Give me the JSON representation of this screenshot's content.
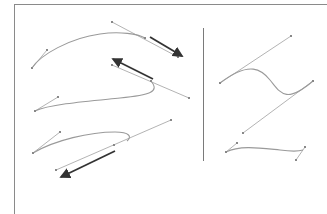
{
  "diagram": {
    "title": "",
    "colors": {
      "background": "#ffffff",
      "frame": "#8a8a8a",
      "divider": "#7a7a7a",
      "curve": "#9a9a9a",
      "handle": "#aaaaaa",
      "anchor": "#888888",
      "arrow": "#333333"
    },
    "left_panel": {
      "curves": [
        {
          "name": "curve-1",
          "path": "M32,68 C40,55 70,38 100,34 C120,31 138,34 145,38",
          "handles": [
            [
              32,
              68,
              47,
              50
            ],
            [
              112,
              22,
              178,
              57
            ]
          ],
          "anchors": [
            [
              32,
              68
            ],
            [
              47,
              50
            ],
            [
              112,
              22
            ],
            [
              145,
              38
            ],
            [
              178,
              57
            ]
          ],
          "arrow": {
            "from": [
              150,
              37
            ],
            "to": [
              182,
              56
            ]
          }
        },
        {
          "name": "curve-2",
          "path": "M35,111 C50,104 90,101 120,98 C150,95 160,92 151,81",
          "handles": [
            [
              35,
              111,
              58,
              97
            ],
            [
              112,
              65,
              189,
              98
            ]
          ],
          "anchors": [
            [
              35,
              111
            ],
            [
              58,
              97
            ],
            [
              112,
              65
            ],
            [
              151,
              81
            ],
            [
              189,
              98
            ]
          ],
          "arrow": {
            "from": [
              153,
              79
            ],
            "to": [
              113,
              59
            ]
          }
        },
        {
          "name": "curve-3",
          "path": "M33,153 C55,140 90,132 115,132 C130,132 132,137 127,141",
          "handles": [
            [
              33,
              153,
              60,
              132
            ],
            [
              56,
              170,
              171,
              120
            ]
          ],
          "anchors": [
            [
              33,
              153
            ],
            [
              60,
              132
            ],
            [
              56,
              170
            ],
            [
              114,
              145
            ],
            [
              171,
              120
            ]
          ],
          "arrow": {
            "from": [
              115,
              151
            ],
            "to": [
              61,
              177
            ]
          }
        }
      ]
    },
    "right_panel": {
      "curves": [
        {
          "name": "s-curve",
          "path": "M220,83 C250,60 262,70 270,80 C280,92 285,105 313,81",
          "handles": [
            [
              220,
              83,
              291,
              36
            ],
            [
              313,
              81,
              243,
              133
            ]
          ],
          "anchors": [
            [
              220,
              83
            ],
            [
              291,
              36
            ],
            [
              313,
              81
            ],
            [
              243,
              133
            ]
          ]
        },
        {
          "name": "wave-curve",
          "path": "M226,152 C240,145 260,148 280,150 C295,152 300,151 303,150",
          "handles": [
            [
              226,
              152,
              237,
              143
            ],
            [
              296,
              160,
              305,
              147
            ]
          ],
          "anchors": [
            [
              226,
              152
            ],
            [
              237,
              143
            ],
            [
              296,
              160
            ],
            [
              305,
              147
            ]
          ]
        }
      ]
    }
  }
}
